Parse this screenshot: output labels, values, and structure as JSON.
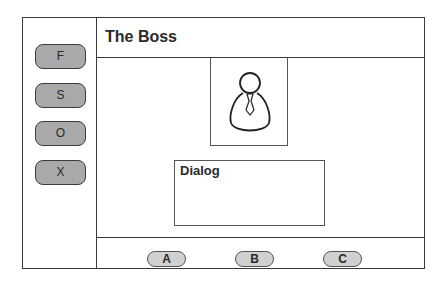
{
  "header": {
    "title": "The Boss"
  },
  "sidebar": {
    "buttons": [
      {
        "label": "F"
      },
      {
        "label": "S"
      },
      {
        "label": "O"
      },
      {
        "label": "X"
      }
    ]
  },
  "portrait": {
    "icon": "person-with-tie-icon"
  },
  "dialog": {
    "title": "Dialog",
    "body": ""
  },
  "footer": {
    "buttons": [
      {
        "label": "A"
      },
      {
        "label": "B"
      },
      {
        "label": "C"
      }
    ]
  },
  "colors": {
    "frame_stroke": "#3a3a3a",
    "side_button_fill": "#a9a9a9",
    "footer_button_fill": "#d0d0d0"
  }
}
